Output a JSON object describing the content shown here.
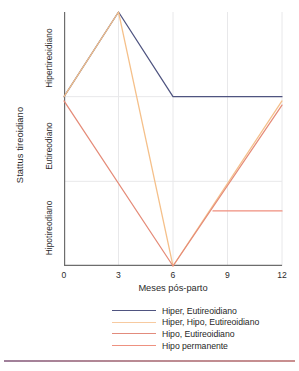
{
  "chart_data": {
    "type": "line",
    "title": "",
    "xlabel": "Meses pós-parto",
    "ylabel": "Stattus tireoidiano",
    "x": [
      0,
      3,
      6,
      9,
      12
    ],
    "xlim": [
      0,
      12
    ],
    "xticks": [
      "0",
      "3",
      "6",
      "9",
      "12"
    ],
    "ylim": [
      0,
      3
    ],
    "ycategories": [
      "Hipotireodiano",
      "Eutireodiano",
      "Hipertireoidiano"
    ],
    "ytick_labels": [
      "Hipotireodiano",
      "Eutireodiano",
      "Hipertireoidiano"
    ],
    "grid": true,
    "legend_position": "bottom",
    "series": [
      {
        "name": "Hiper, Eutireoidiano",
        "color": "#4f5480",
        "x": [
          0,
          3,
          6,
          12
        ],
        "values": [
          2.0,
          3.0,
          2.0,
          2.0
        ]
      },
      {
        "name": "Hiper, Hipo, Eutireoidiano",
        "color": "#f5c08a",
        "x": [
          0,
          3,
          6,
          12
        ],
        "values": [
          2.0,
          3.0,
          0.0,
          1.95
        ]
      },
      {
        "name": "Hipo, Eutireoidiano",
        "color": "#e58b78",
        "x": [
          0,
          6,
          12
        ],
        "values": [
          1.95,
          0.0,
          1.9
        ]
      },
      {
        "name": "Hipo permanente",
        "color": "#ef8f7f",
        "x": [
          8.2,
          12
        ],
        "values": [
          0.65,
          0.65
        ]
      }
    ]
  },
  "axes": {
    "y_title": "Stattus tireoidiano",
    "y_categories": {
      "hyper": "Hipertireoidiano",
      "eu": "Eutireodiano",
      "hypo": "Hipotireodiano"
    },
    "x_title": "Meses pós-parto",
    "x_ticks": [
      {
        "label": "0",
        "pos": 0
      },
      {
        "label": "3",
        "pos": 54.5
      },
      {
        "label": "6",
        "pos": 109
      },
      {
        "label": "9",
        "pos": 163.5
      },
      {
        "label": "12",
        "pos": 218
      }
    ]
  },
  "legend": {
    "items": [
      {
        "label": "Hiper, Eutireoidiano",
        "color": "#4f5480"
      },
      {
        "label": "Hiper, Hipo, Eutireoidiano",
        "color": "#f7caa0"
      },
      {
        "label": "Hipo, Eutireoidiano",
        "color": "#e28b7c"
      },
      {
        "label": "Hipo permanente",
        "color": "#ee9180"
      }
    ]
  },
  "colors": {
    "axis": "#6d6d6d",
    "grid": "#e8e8ea",
    "text": "#2b2b2b",
    "rule": "#b4889a"
  }
}
